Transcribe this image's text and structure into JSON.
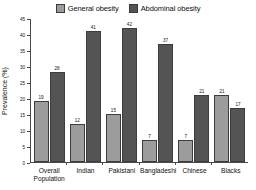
{
  "chart_data": {
    "type": "bar",
    "title": "",
    "subtitle": "",
    "xlabel": "",
    "ylabel": "Prevalence (%)",
    "ylim": [
      0,
      45
    ],
    "ytick_step": 5,
    "yticks": [
      "0",
      "5",
      "10",
      "15",
      "20",
      "25",
      "30",
      "35",
      "40",
      "45"
    ],
    "grid": false,
    "legend_position": "top-center",
    "categories": [
      "Overall\nPopulation",
      "Indian",
      "Pakistani",
      "Bangladeshi",
      "Chinese",
      "Blacks"
    ],
    "series": [
      {
        "name": "General obesity",
        "color": "#9c9c9c",
        "values": [
          19,
          12,
          15,
          7,
          7,
          21
        ]
      },
      {
        "name": "Abdominal obesity",
        "color": "#545454",
        "values": [
          28,
          41,
          42,
          37,
          21,
          17
        ]
      }
    ]
  },
  "legend": {
    "items": [
      {
        "label": "General obesity",
        "swatch": "legend-swatch-general"
      },
      {
        "label": "Abdominal obesity",
        "swatch": "legend-swatch-abdominal"
      }
    ]
  },
  "axis": {
    "y_title": "Prevalence (%)"
  }
}
